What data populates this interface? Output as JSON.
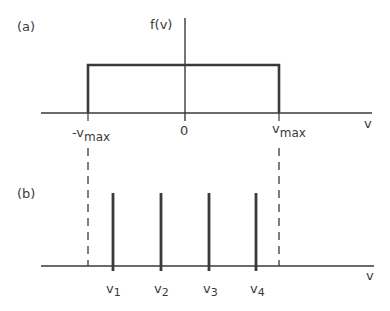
{
  "panel_a": {
    "label": "(a)",
    "y_axis_label": "f(v)",
    "x_axis_label": "v",
    "tick_left": "-v",
    "tick_left_sub": "max",
    "tick_center": "0",
    "tick_right": "v",
    "tick_right_sub": "max",
    "description": "Uniform (rectangular) distribution f(v) between -v_max and v_max"
  },
  "panel_b": {
    "label": "(b)",
    "x_axis_label": "v",
    "lines": [
      {
        "label": "v",
        "sub": "1"
      },
      {
        "label": "v",
        "sub": "2"
      },
      {
        "label": "v",
        "sub": "3"
      },
      {
        "label": "v",
        "sub": "4"
      }
    ],
    "description": "Discrete values v1..v4 within dashed bounds at -v_max and v_max"
  },
  "colors": {
    "ink": "#3a3a3a",
    "background": "#ffffff"
  }
}
